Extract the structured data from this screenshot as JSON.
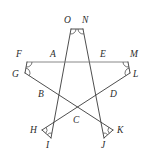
{
  "figure": {
    "background_color": "#ffffff",
    "line_color": "#3a3a3a",
    "horizontal_line_color": "#7a7a7a",
    "label_color": "#2b2b2b",
    "width": 151,
    "height": 159
  },
  "vertices": [
    {
      "id": "A",
      "label": "A",
      "x": 58,
      "y": 62,
      "label_x": 50,
      "label_y": 50,
      "role": "inner-pentagon"
    },
    {
      "id": "B",
      "label": "B",
      "x": 48,
      "y": 96,
      "label_x": 38,
      "label_y": 90,
      "role": "inner-pentagon"
    },
    {
      "id": "C",
      "label": "C",
      "x": 77,
      "y": 115,
      "label_x": 73,
      "label_y": 116,
      "role": "inner-pentagon"
    },
    {
      "id": "D",
      "label": "D",
      "x": 108,
      "y": 96,
      "label_x": 110,
      "label_y": 90,
      "role": "inner-pentagon"
    },
    {
      "id": "E",
      "label": "E",
      "x": 99,
      "y": 62,
      "label_x": 100,
      "label_y": 50,
      "role": "inner-pentagon"
    },
    {
      "id": "F",
      "label": "F",
      "x": 27,
      "y": 62,
      "label_x": 16,
      "label_y": 50,
      "role": "outer-point"
    },
    {
      "id": "G",
      "label": "G",
      "x": 25,
      "y": 73,
      "label_x": 12,
      "label_y": 70,
      "role": "outer-point"
    },
    {
      "id": "H",
      "label": "H",
      "x": 42,
      "y": 130,
      "label_x": 30,
      "label_y": 126,
      "role": "outer-point"
    },
    {
      "id": "I",
      "label": "I",
      "x": 51,
      "y": 138,
      "label_x": 46,
      "label_y": 141,
      "role": "outer-point"
    },
    {
      "id": "J",
      "label": "J",
      "x": 104,
      "y": 138,
      "label_x": 101,
      "label_y": 141,
      "role": "outer-point"
    },
    {
      "id": "K",
      "label": "K",
      "x": 113,
      "y": 130,
      "label_x": 117,
      "label_y": 126,
      "role": "outer-point"
    },
    {
      "id": "L",
      "label": "L",
      "x": 130,
      "y": 73,
      "label_x": 133,
      "label_y": 70,
      "role": "outer-point"
    },
    {
      "id": "M",
      "label": "M",
      "x": 128,
      "y": 62,
      "label_x": 130,
      "label_y": 50,
      "role": "outer-point"
    },
    {
      "id": "N",
      "label": "N",
      "x": 83,
      "y": 29,
      "label_x": 82,
      "label_y": 16,
      "role": "outer-point"
    },
    {
      "id": "O",
      "label": "O",
      "x": 71,
      "y": 29,
      "label_x": 64,
      "label_y": 16,
      "role": "outer-point"
    }
  ],
  "edges": [
    {
      "from": "O",
      "to": "I",
      "x1": 71,
      "y1": 29,
      "x2": 51,
      "y2": 138,
      "style": "dark"
    },
    {
      "from": "N",
      "to": "J",
      "x1": 83,
      "y1": 29,
      "x2": 104,
      "y2": 138,
      "style": "dark"
    },
    {
      "from": "O",
      "to": "N",
      "x1": 71,
      "y1": 29,
      "x2": 83,
      "y2": 29,
      "style": "dark"
    },
    {
      "from": "F",
      "to": "M",
      "x1": 27,
      "y1": 62,
      "x2": 128,
      "y2": 62,
      "style": "light"
    },
    {
      "from": "F",
      "to": "G",
      "x1": 27,
      "y1": 62,
      "x2": 25,
      "y2": 73,
      "style": "dark"
    },
    {
      "from": "G",
      "to": "K",
      "x1": 25,
      "y1": 73,
      "x2": 113,
      "y2": 130,
      "style": "dark"
    },
    {
      "from": "M",
      "to": "L",
      "x1": 128,
      "y1": 62,
      "x2": 130,
      "y2": 73,
      "style": "dark"
    },
    {
      "from": "L",
      "to": "H",
      "x1": 130,
      "y1": 73,
      "x2": 42,
      "y2": 130,
      "style": "dark"
    },
    {
      "from": "H",
      "to": "I",
      "x1": 42,
      "y1": 130,
      "x2": 51,
      "y2": 138,
      "style": "dark"
    },
    {
      "from": "J",
      "to": "K",
      "x1": 104,
      "y1": 138,
      "x2": 113,
      "y2": 130,
      "style": "dark"
    }
  ],
  "angle_marks": [
    {
      "at": "O",
      "cx": 71,
      "cy": 29,
      "r": 5
    },
    {
      "at": "N",
      "cx": 83,
      "cy": 29,
      "r": 5
    },
    {
      "at": "F",
      "cx": 27,
      "cy": 62,
      "r": 5
    },
    {
      "at": "G",
      "cx": 25,
      "cy": 73,
      "r": 5
    },
    {
      "at": "M",
      "cx": 128,
      "cy": 62,
      "r": 5
    },
    {
      "at": "L",
      "cx": 130,
      "cy": 73,
      "r": 5
    },
    {
      "at": "H",
      "cx": 42,
      "cy": 130,
      "r": 5
    },
    {
      "at": "I",
      "cx": 51,
      "cy": 138,
      "r": 5
    },
    {
      "at": "J",
      "cx": 104,
      "cy": 138,
      "r": 5
    },
    {
      "at": "K",
      "cx": 113,
      "cy": 130,
      "r": 5
    }
  ]
}
